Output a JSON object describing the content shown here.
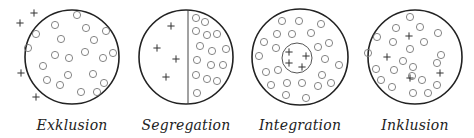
{
  "diagrams": [
    {
      "label": "Exklusion",
      "cx": 72,
      "cy": 57,
      "r": 47,
      "divider": null,
      "inner_circle": null,
      "small_circles": [
        [
          77,
          15
        ],
        [
          55,
          25
        ],
        [
          86,
          28
        ],
        [
          106,
          31
        ],
        [
          36,
          34
        ],
        [
          61,
          39
        ],
        [
          94,
          40
        ],
        [
          28,
          48
        ],
        [
          55,
          55
        ],
        [
          69,
          58
        ],
        [
          85,
          52
        ],
        [
          103,
          58
        ],
        [
          113,
          53
        ],
        [
          43,
          66
        ],
        [
          68,
          75
        ],
        [
          93,
          74
        ],
        [
          47,
          80
        ],
        [
          60,
          85
        ],
        [
          104,
          83
        ],
        [
          81,
          92
        ],
        [
          97,
          92
        ]
      ],
      "plus_signs": [
        [
          20,
          23
        ],
        [
          34,
          13
        ],
        [
          21,
          73
        ],
        [
          36,
          97
        ]
      ]
    },
    {
      "label": "Segregation",
      "cx": 186,
      "cy": 57,
      "r": 47,
      "divider": {
        "x": 188
      },
      "inner_circle": null,
      "small_circles": [
        [
          196,
          18
        ],
        [
          205,
          22
        ],
        [
          196,
          31
        ],
        [
          207,
          35
        ],
        [
          217,
          34
        ],
        [
          200,
          46
        ],
        [
          212,
          51
        ],
        [
          226,
          49
        ],
        [
          197,
          60
        ],
        [
          211,
          65
        ],
        [
          223,
          65
        ],
        [
          196,
          75
        ],
        [
          207,
          79
        ],
        [
          217,
          81
        ],
        [
          197,
          93
        ]
      ],
      "plus_signs": [
        [
          171,
          26
        ],
        [
          157,
          48
        ],
        [
          176,
          59
        ],
        [
          166,
          77
        ]
      ]
    },
    {
      "label": "Integration",
      "cx": 300,
      "cy": 57,
      "r": 48,
      "divider": null,
      "inner_circle": {
        "cx": 297,
        "cy": 58,
        "r": 15
      },
      "small_circles": [
        [
          282,
          21
        ],
        [
          299,
          21
        ],
        [
          321,
          24
        ],
        [
          277,
          34
        ],
        [
          292,
          34
        ],
        [
          311,
          33
        ],
        [
          264,
          42
        ],
        [
          276,
          48
        ],
        [
          318,
          47
        ],
        [
          329,
          43
        ],
        [
          259,
          56
        ],
        [
          325,
          59
        ],
        [
          339,
          65
        ],
        [
          266,
          72
        ],
        [
          278,
          70
        ],
        [
          322,
          75
        ],
        [
          271,
          85
        ],
        [
          287,
          83
        ],
        [
          302,
          83
        ],
        [
          318,
          86
        ],
        [
          331,
          83
        ],
        [
          286,
          95
        ],
        [
          306,
          98
        ]
      ],
      "plus_signs": [
        [
          289,
          52
        ],
        [
          306,
          56
        ],
        [
          289,
          63
        ],
        [
          302,
          67
        ]
      ]
    },
    {
      "label": "Inklusion",
      "cx": 415,
      "cy": 57,
      "r": 47,
      "divider": null,
      "inner_circle": null,
      "small_circles": [
        [
          410,
          17
        ],
        [
          396,
          28
        ],
        [
          420,
          27
        ],
        [
          438,
          33
        ],
        [
          377,
          37
        ],
        [
          393,
          42
        ],
        [
          424,
          42
        ],
        [
          368,
          53
        ],
        [
          410,
          49
        ],
        [
          441,
          55
        ],
        [
          403,
          61
        ],
        [
          376,
          69
        ],
        [
          394,
          70
        ],
        [
          413,
          67
        ],
        [
          437,
          63
        ],
        [
          381,
          80
        ],
        [
          422,
          80
        ],
        [
          412,
          76
        ],
        [
          437,
          85
        ],
        [
          392,
          87
        ],
        [
          413,
          93
        ],
        [
          428,
          93
        ]
      ],
      "plus_signs": [
        [
          409,
          36
        ],
        [
          387,
          57
        ],
        [
          410,
          78
        ],
        [
          440,
          73
        ]
      ]
    }
  ],
  "style": {
    "stroke_color": "#222222",
    "small_circle_color": "#777777",
    "small_circle_radius": 3.6
  }
}
